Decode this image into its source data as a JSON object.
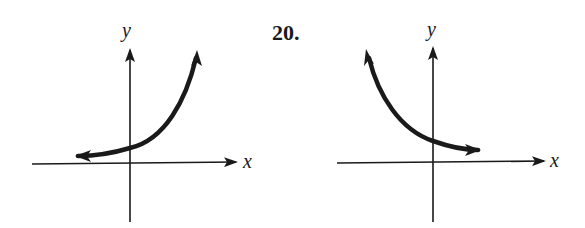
{
  "problem_number": "20.",
  "graphs": [
    {
      "id": "left",
      "x_label": "x",
      "y_label": "y",
      "curve": "exponential-growth",
      "description": "Increasing curve, approaches x-axis asymptotically to the left, rising steeply to the right; crosses y-axis above origin"
    },
    {
      "id": "right",
      "x_label": "x",
      "y_label": "y",
      "curve": "exponential-decay",
      "description": "Decreasing curve, rising steeply to the left, approaches x-axis asymptotically to the right; crosses y-axis above origin"
    }
  ],
  "colors": {
    "ink": "#1a1a1a",
    "background": "#ffffff"
  }
}
